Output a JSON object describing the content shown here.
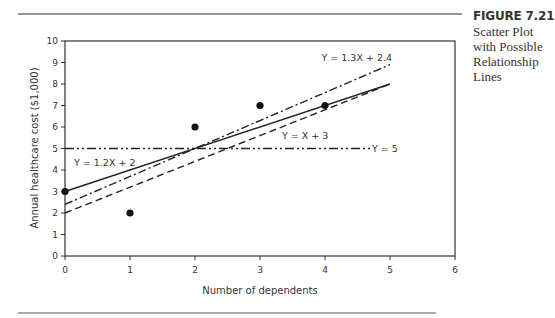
{
  "figure": {
    "number": "FIGURE 7.21",
    "title": "Scatter Plot with Possible Relationship Lines"
  },
  "chart_data": {
    "type": "scatter",
    "title": "Scatter Plot with Possible Relationship Lines",
    "xlabel": "Number of dependents",
    "ylabel": "Annual healthcare cost ($1,000)",
    "xlim": [
      0,
      6
    ],
    "ylim": [
      0,
      10
    ],
    "xticks": [
      0,
      1,
      2,
      3,
      4,
      5,
      6
    ],
    "yticks": [
      0,
      1,
      2,
      3,
      4,
      5,
      6,
      7,
      8,
      9,
      10
    ],
    "grid": false,
    "points": [
      {
        "x": 0,
        "y": 3
      },
      {
        "x": 1,
        "y": 2
      },
      {
        "x": 2,
        "y": 6
      },
      {
        "x": 3,
        "y": 7
      },
      {
        "x": 4,
        "y": 7
      }
    ],
    "lines": [
      {
        "label": "Y = X + 3",
        "slope": 1,
        "intercept": 3,
        "x_range": [
          0,
          5
        ],
        "style": "solid"
      },
      {
        "label": "Y = 1.2X + 2",
        "slope": 1.2,
        "intercept": 2,
        "x_range": [
          0,
          5
        ],
        "style": "dashed"
      },
      {
        "label": "Y = 1.3X + 2.4",
        "slope": 1.3,
        "intercept": 2.4,
        "x_range": [
          0,
          5
        ],
        "style": "dash-dot"
      },
      {
        "label": "Y = 5",
        "slope": 0,
        "intercept": 5,
        "x_range": [
          0,
          4.7
        ],
        "style": "dash-dot-dot"
      }
    ]
  }
}
